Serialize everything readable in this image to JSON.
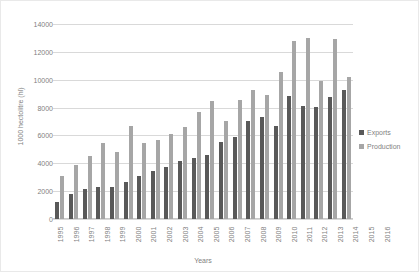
{
  "chart_data": {
    "type": "bar",
    "title": "",
    "xlabel": "Years",
    "ylabel": "1000 hectolitre (hl)",
    "ylim": [
      0,
      14000
    ],
    "ytick_step": 2000,
    "yticks": [
      "0",
      "2000",
      "4000",
      "6000",
      "8000",
      "10000",
      "12000",
      "14000"
    ],
    "grid": true,
    "legend_position": "right",
    "categories": [
      "1995",
      "1996",
      "1997",
      "1998",
      "1999",
      "2000",
      "2001",
      "2002",
      "2003",
      "2004",
      "2005",
      "2006",
      "2007",
      "2008",
      "2009",
      "2010",
      "2011",
      "2012",
      "2013",
      "2014",
      "2015",
      "2016"
    ],
    "series": [
      {
        "name": "Exports",
        "color": "#595959",
        "values": [
          1250,
          1800,
          2150,
          2300,
          2300,
          2650,
          3100,
          3450,
          3750,
          4150,
          4350,
          4600,
          5500,
          5900,
          7050,
          7300,
          6700,
          8800,
          8100,
          8050,
          8750,
          9250
        ]
      },
      {
        "name": "Production",
        "color": "#a6a6a6",
        "values": [
          3100,
          3850,
          4500,
          5450,
          4800,
          6700,
          5450,
          5650,
          6100,
          6600,
          7650,
          8450,
          7050,
          8550,
          9250,
          8900,
          10550,
          12750,
          13000,
          9900,
          12950,
          10200
        ]
      }
    ]
  },
  "legend": {
    "items": [
      {
        "label": "Exports",
        "color": "#595959"
      },
      {
        "label": "Production",
        "color": "#a6a6a6"
      }
    ]
  }
}
